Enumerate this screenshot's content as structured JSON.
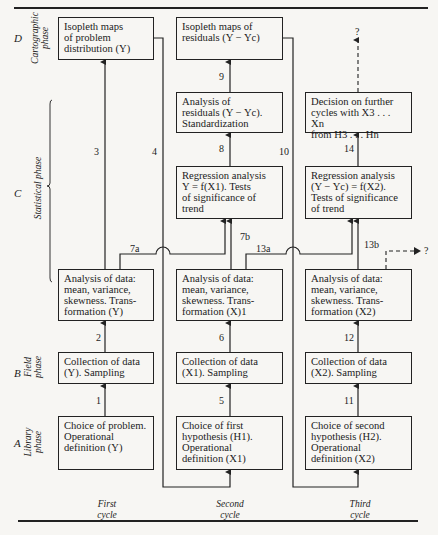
{
  "phases": [
    {
      "letter": "D",
      "name": "Cartographic\nphase"
    },
    {
      "letter": "C",
      "name": "Statistical phase"
    },
    {
      "letter": "B",
      "name": "Field\nphase"
    },
    {
      "letter": "A",
      "name": "Library\nphase"
    }
  ],
  "cycles": [
    {
      "label": "First\ncycle"
    },
    {
      "label": "Second\ncycle"
    },
    {
      "label": "Third\ncycle"
    }
  ],
  "boxes": {
    "c1_d": "Isopleth maps\nof problem\ndistribution (Y)",
    "c1_c": "Analysis of data:\nmean, variance,\nskewness. Trans-\nformation (Y)",
    "c1_b": "Collection of data\n(Y). Sampling",
    "c1_a": "Choice of problem.\nOperational\ndefinition (Y)",
    "c2_d": "Isopleth maps of\nresiduals (Y − Yc)",
    "c2_resid": "Analysis of\nresiduals (Y − Yc).\nStandardization",
    "c2_regr": "Regression analysis\nY = f(X1). Tests\nof significance of\ntrend",
    "c2_c": "Analysis of data:\nmean, variance,\nskewness. Trans-\nformation (X)1",
    "c2_b": "Collection of data\n(X1). Sampling",
    "c2_a": "Choice of first\nhypothesis (H1).\nOperational\ndefinition (X1)",
    "c3_decision": "Decision on further\ncycles with X3 . . . Xn\nfrom H3 . . . Hn",
    "c3_regr": "Regression analysis\n(Y − Yc) = f(X2).\nTests of significance\nof trend",
    "c3_c": "Analysis of data:\nmean, variance,\nskewness. Trans-\nformation (X2)",
    "c3_b": "Collection of data\n(X2). Sampling",
    "c3_a": "Choice of second\nhypothesis (H2).\nOperational\ndefinition (X2)"
  },
  "edges": {
    "e1": "1",
    "e2": "2",
    "e3": "3",
    "e4": "4",
    "e5": "5",
    "e6": "6",
    "e7a": "7a",
    "e7b": "7b",
    "e8": "8",
    "e9": "9",
    "e10": "10",
    "e11": "11",
    "e12": "12",
    "e13a": "13a",
    "e13b": "13b",
    "e14": "14",
    "q_top": "?",
    "q_side": "?"
  }
}
